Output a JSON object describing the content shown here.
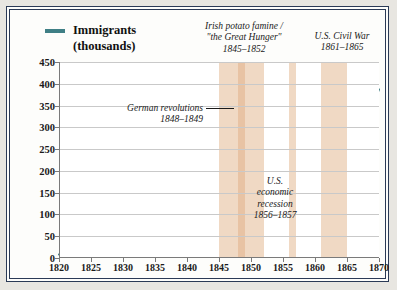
{
  "legend": {
    "label_line1": "Immigrants",
    "label_line2": "(thousands)",
    "color": "#3f7f85"
  },
  "annotations": {
    "famine": {
      "line1": "Irish potato famine /",
      "line2": "\"the Great Hunger\"",
      "line3": "1845–1852"
    },
    "civil_war": {
      "line1": "U.S. Civil War",
      "line2": "1861–1865"
    },
    "german": {
      "line1": "German revolutions",
      "line2": "1848–1849"
    },
    "recession": {
      "line1": "U.S.",
      "line2": "economic",
      "line3": "recession",
      "line4": "1856–1857"
    }
  },
  "chart_data": {
    "type": "line",
    "title": "",
    "xlabel": "",
    "ylabel": "Immigrants (thousands)",
    "xlim": [
      1820,
      1870
    ],
    "ylim": [
      0,
      450
    ],
    "ytick_step": 50,
    "xtick_step": 5,
    "grid": true,
    "legend_position": "top-left",
    "line_color": "#3f7f85",
    "band_color": "#f0d9c4",
    "band_inner_color": "#e8c3a4",
    "yticks": [
      0,
      50,
      100,
      150,
      200,
      250,
      300,
      350,
      400,
      450
    ],
    "xticks": [
      1820,
      1825,
      1830,
      1835,
      1840,
      1845,
      1850,
      1855,
      1860,
      1865,
      1870
    ],
    "shaded_bands": [
      {
        "name": "Irish potato famine",
        "start": 1845,
        "end": 1852,
        "inner_start": 1848,
        "inner_end": 1849
      },
      {
        "name": "U.S. economic recession",
        "start": 1856,
        "end": 1857
      },
      {
        "name": "U.S. Civil War",
        "start": 1861,
        "end": 1865
      }
    ],
    "x": [
      1820,
      1821,
      1822,
      1823,
      1824,
      1825,
      1826,
      1827,
      1828,
      1829,
      1830,
      1831,
      1832,
      1833,
      1834,
      1835,
      1836,
      1837,
      1838,
      1839,
      1840,
      1841,
      1842,
      1843,
      1844,
      1845,
      1846,
      1847,
      1848,
      1849,
      1850,
      1851,
      1852,
      1853,
      1854,
      1855,
      1856,
      1857,
      1858,
      1859,
      1860,
      1861,
      1862,
      1863,
      1864,
      1865,
      1866,
      1867,
      1868,
      1869,
      1870
    ],
    "values": [
      8,
      9,
      6,
      6,
      8,
      10,
      11,
      18,
      27,
      22,
      23,
      23,
      60,
      59,
      65,
      45,
      76,
      79,
      38,
      68,
      84,
      80,
      104,
      52,
      79,
      114,
      154,
      235,
      226,
      297,
      310,
      379,
      372,
      368,
      427,
      200,
      200,
      251,
      123,
      121,
      153,
      91,
      92,
      176,
      193,
      248,
      319,
      315,
      138,
      352,
      387
    ],
    "series": [
      {
        "name": "Immigrants (thousands)",
        "color": "#3f7f85"
      }
    ]
  }
}
